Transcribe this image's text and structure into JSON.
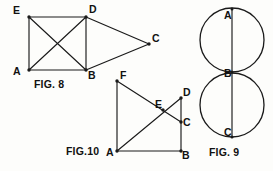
{
  "page": {
    "background_color": "#fdfdfb",
    "ink_color": "#1a1a1a",
    "width": 273,
    "height": 171
  },
  "figures": [
    {
      "id": "fig8",
      "caption": "FIG. 8",
      "caption_x": 34,
      "caption_y": 87,
      "type": "polygon-diagram",
      "points": {
        "E": {
          "x": 29,
          "y": 17,
          "label": "E",
          "label_x": 13,
          "label_y": 14
        },
        "D": {
          "x": 86,
          "y": 17,
          "label": "D",
          "label_x": 89,
          "label_y": 13
        },
        "A": {
          "x": 29,
          "y": 70,
          "label": "A",
          "label_x": 13,
          "label_y": 75
        },
        "B": {
          "x": 86,
          "y": 70,
          "label": "B",
          "label_x": 88,
          "label_y": 77
        },
        "C": {
          "x": 149,
          "y": 44,
          "label": "C",
          "label_x": 152,
          "label_y": 42
        }
      },
      "edges": [
        [
          "E",
          "D"
        ],
        [
          "E",
          "A"
        ],
        [
          "A",
          "B"
        ],
        [
          "D",
          "B"
        ],
        [
          "E",
          "B"
        ],
        [
          "A",
          "D"
        ],
        [
          "D",
          "C"
        ],
        [
          "B",
          "C"
        ]
      ]
    },
    {
      "id": "fig10",
      "caption": "FIG.10",
      "caption_x": 66,
      "caption_y": 154,
      "type": "polygon-diagram",
      "points": {
        "F": {
          "x": 117,
          "y": 81,
          "label": "F",
          "label_x": 120,
          "label_y": 78
        },
        "A": {
          "x": 117,
          "y": 151,
          "label": "A",
          "label_x": 106,
          "label_y": 155
        },
        "B": {
          "x": 181,
          "y": 151,
          "label": "B",
          "label_x": 182,
          "label_y": 157
        },
        "D": {
          "x": 181,
          "y": 98,
          "label": "D",
          "label_x": 183,
          "label_y": 95
        },
        "C": {
          "x": 181,
          "y": 122,
          "label": "C",
          "label_x": 183,
          "label_y": 126
        },
        "E": {
          "x": 163,
          "y": 110,
          "label": "E",
          "label_x": 156,
          "label_y": 107
        }
      },
      "edges": [
        [
          "F",
          "A"
        ],
        [
          "A",
          "B"
        ],
        [
          "B",
          "D"
        ],
        [
          "F",
          "C"
        ],
        [
          "A",
          "D"
        ]
      ]
    },
    {
      "id": "fig9",
      "caption": "FIG. 9",
      "caption_x": 209,
      "caption_y": 155,
      "type": "tangent-circles",
      "circles": [
        {
          "cx": 232,
          "cy": 40,
          "r": 32,
          "name": "upper-circle"
        },
        {
          "cx": 232,
          "cy": 105,
          "r": 32,
          "name": "lower-circle"
        }
      ],
      "chord": {
        "x1": 232,
        "y1": 9,
        "x2": 232,
        "y2": 137
      },
      "points": {
        "A": {
          "x": 232,
          "y": 14,
          "label": "A",
          "label_x": 224,
          "label_y": 18
        },
        "B": {
          "x": 232,
          "y": 72,
          "label": "B",
          "label_x": 224,
          "label_y": 76
        },
        "C": {
          "x": 232,
          "y": 133,
          "label": "C",
          "label_x": 224,
          "label_y": 137
        }
      }
    }
  ]
}
